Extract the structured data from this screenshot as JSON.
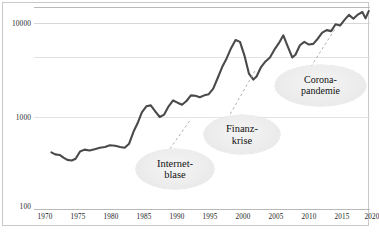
{
  "chart_data": {
    "type": "line",
    "title": "",
    "subtitle": "",
    "xlabel": "",
    "ylabel": "",
    "scale": "log",
    "grid": true,
    "legend": "none",
    "xlim": [
      1970,
      2021
    ],
    "ylim": [
      100,
      16000
    ],
    "xticks": [
      "1970",
      "1975",
      "1980",
      "1985",
      "1990",
      "1995",
      "2000",
      "2005",
      "2010",
      "2015",
      "2020"
    ],
    "yticks": [
      "100",
      "1000",
      "10000"
    ],
    "series": [
      {
        "name": "Index",
        "color": "#4a4a4a",
        "x": [
          1971.0,
          1971.6,
          1972.3,
          1972.9,
          1973.5,
          1974.2,
          1974.8,
          1975.5,
          1976.2,
          1977.0,
          1977.8,
          1978.6,
          1979.4,
          1980.2,
          1981.0,
          1981.8,
          1982.5,
          1983.2,
          1983.9,
          1984.6,
          1985.2,
          1985.9,
          1986.6,
          1987.3,
          1988.0,
          1988.7,
          1989.4,
          1990.1,
          1990.8,
          1991.5,
          1992.2,
          1992.9,
          1993.6,
          1994.3,
          1995.0,
          1995.7,
          1996.4,
          1997.1,
          1997.8,
          1998.5,
          1999.2,
          1999.9,
          2000.6,
          2001.3,
          2002.0,
          2002.7,
          2003.2,
          2003.9,
          2004.6,
          2005.3,
          2006.0,
          2006.7,
          2007.4,
          2008.1,
          2008.8,
          2009.3,
          2010.0,
          2010.7,
          2011.4,
          2012.1,
          2012.8,
          2013.5,
          2014.2,
          2014.9,
          2015.6,
          2016.3,
          2017.0,
          2017.7,
          2018.4,
          2019.1,
          2019.8,
          2020.3,
          2020.8
        ],
        "y": [
          420,
          400,
          395,
          370,
          350,
          345,
          360,
          430,
          450,
          440,
          455,
          470,
          480,
          500,
          495,
          480,
          470,
          520,
          700,
          880,
          1120,
          1300,
          1330,
          1150,
          1000,
          1060,
          1300,
          1500,
          1420,
          1350,
          1480,
          1700,
          1680,
          1620,
          1700,
          1750,
          2000,
          2600,
          3400,
          4200,
          5400,
          6600,
          6300,
          4500,
          2900,
          2500,
          2700,
          3400,
          3900,
          4300,
          5200,
          6100,
          7400,
          5600,
          4300,
          4600,
          5800,
          6300,
          5900,
          6000,
          6800,
          7900,
          8400,
          8200,
          9700,
          9400,
          10800,
          12200,
          11100,
          12300,
          13100,
          11200,
          13400
        ]
      }
    ],
    "annotations": [
      {
        "id": "internetblase",
        "lines": [
          "Internet-",
          "blase"
        ],
        "text": "Internet-blase"
      },
      {
        "id": "finanzkrise",
        "lines": [
          "Finanz-",
          "krise"
        ],
        "text": "Finanz-krise"
      },
      {
        "id": "coronapandemie",
        "lines": [
          "Corona-",
          "pandemie"
        ],
        "text": "Corona-pandemie"
      }
    ]
  },
  "axes": {
    "y_labels": [
      "10000",
      "1000",
      "100"
    ],
    "x_labels": [
      "1970",
      "1975",
      "1980",
      "1985",
      "1990",
      "1995",
      "2000",
      "2005",
      "2010",
      "2015",
      "2020"
    ]
  },
  "annotations": {
    "internetblase": {
      "line1": "Internet-",
      "line2": "blase"
    },
    "finanzkrise": {
      "line1": "Finanz-",
      "line2": "krise"
    },
    "coronapandemie": {
      "line1": "Corona-",
      "line2": "pandemie"
    }
  },
  "colors": {
    "line": "#4a4a4a",
    "grid": "#d8d8d8",
    "frame": "#c9c9c9",
    "bubble": "#ededed",
    "leader": "#8a8a8a"
  },
  "footer": {
    "smudge": ""
  }
}
